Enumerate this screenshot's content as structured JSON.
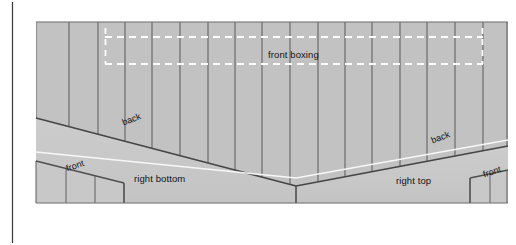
{
  "figure": {
    "background_color": "#ffffff",
    "panel_fill": "#c2c2c2",
    "panel_fill_light": "#cfcfcf",
    "line_color": "#555555",
    "border_color": "#3a3a3a",
    "dash_color": "#ffffff",
    "highlight_line_color": "#ffffff"
  },
  "labels": {
    "front_boxing": "front boxing",
    "right_bottom": "right bottom",
    "right_top": "right top",
    "back_left": "back",
    "back_right": "back",
    "front_left": "front",
    "front_right": "front"
  },
  "regions": [
    {
      "name": "front-boxing-zone",
      "label": "front boxing"
    },
    {
      "name": "right-bottom-zone",
      "label": "right bottom"
    },
    {
      "name": "right-top-zone",
      "label": "right top"
    },
    {
      "name": "back-edge-left",
      "label": "back"
    },
    {
      "name": "back-edge-right",
      "label": "back"
    },
    {
      "name": "front-edge-left",
      "label": "front"
    },
    {
      "name": "front-edge-right",
      "label": "front"
    }
  ]
}
